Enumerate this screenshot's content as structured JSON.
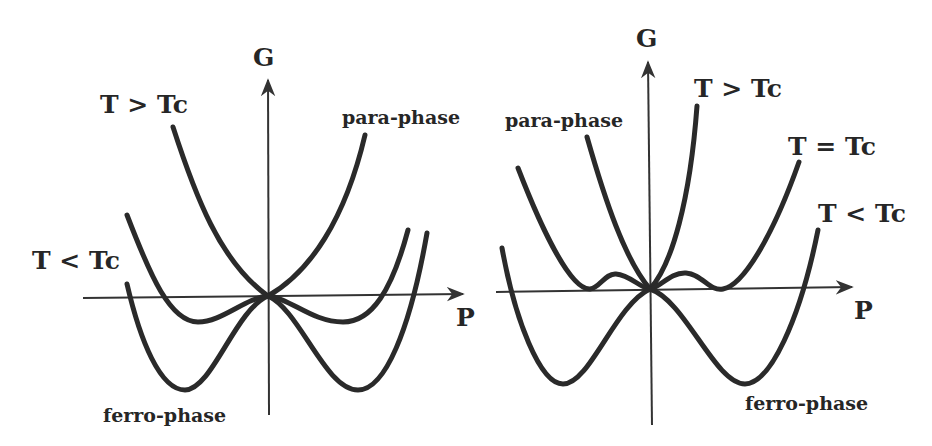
{
  "figure": {
    "panels": [
      {
        "id": "left",
        "axis_labels": {
          "y": "G",
          "x": "P"
        },
        "curve_labels": {
          "above": "T > Tc",
          "below": "T < Tc",
          "para": "para-phase",
          "ferro": "ferro-phase"
        },
        "description": "Second-order transition: Gibbs free energy G vs polarization P. Single minimum at P=0 for T > Tc; double minima for T < Tc."
      },
      {
        "id": "right",
        "axis_labels": {
          "y": "G",
          "x": "P"
        },
        "curve_labels": {
          "above": "T > Tc",
          "equal": "T = Tc",
          "below": "T < Tc",
          "para": "para-phase",
          "ferro": "ferro-phase"
        },
        "description": "First-order transition: at T = Tc three equal minima coexist; T < Tc side minima deeper."
      }
    ]
  }
}
